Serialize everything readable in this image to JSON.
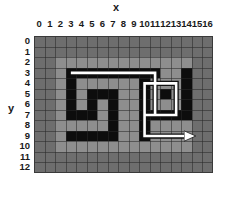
{
  "axes": {
    "x_title": "x",
    "y_title": "y",
    "x_ticks": [
      "0",
      "1",
      "2",
      "3",
      "4",
      "5",
      "6",
      "7",
      "8",
      "9",
      "10",
      "11",
      "12",
      "13",
      "14",
      "15",
      "16"
    ],
    "y_ticks": [
      "0",
      "1",
      "2",
      "3",
      "4",
      "5",
      "6",
      "7",
      "8",
      "9",
      "10",
      "11",
      "12"
    ]
  },
  "colors": {
    "background": "#6e6e6e",
    "open": "#8e8e8e",
    "wall": "#0d0d0d",
    "path": "#ffffff",
    "gridline": "#3a3a3a",
    "text": "#1a1a1a"
  },
  "chart_data": {
    "type": "heatmap",
    "title": "",
    "xlabel": "x",
    "ylabel": "y",
    "xlim": [
      0,
      16
    ],
    "ylim": [
      0,
      12
    ],
    "grid": true,
    "legend": "none",
    "cell_size_px": 10.53,
    "value_legend": {
      "0": "background",
      "1": "open",
      "2": "wall"
    },
    "grid_values": [
      [
        0,
        0,
        0,
        0,
        0,
        0,
        0,
        0,
        0,
        0,
        0,
        0,
        0,
        0,
        0,
        0,
        0
      ],
      [
        0,
        0,
        0,
        0,
        0,
        0,
        0,
        0,
        0,
        0,
        0,
        0,
        0,
        0,
        0,
        0,
        0
      ],
      [
        0,
        0,
        1,
        1,
        1,
        1,
        1,
        1,
        1,
        1,
        1,
        1,
        1,
        1,
        1,
        0,
        0
      ],
      [
        0,
        0,
        1,
        2,
        2,
        2,
        2,
        2,
        2,
        2,
        2,
        2,
        1,
        1,
        2,
        0,
        0
      ],
      [
        0,
        0,
        1,
        2,
        1,
        1,
        1,
        1,
        1,
        1,
        2,
        1,
        1,
        1,
        2,
        0,
        0
      ],
      [
        0,
        0,
        1,
        2,
        1,
        2,
        2,
        2,
        1,
        1,
        2,
        1,
        2,
        1,
        2,
        0,
        0
      ],
      [
        0,
        0,
        1,
        2,
        1,
        2,
        1,
        2,
        1,
        1,
        2,
        1,
        1,
        1,
        2,
        0,
        0
      ],
      [
        0,
        0,
        1,
        2,
        2,
        2,
        1,
        2,
        1,
        1,
        2,
        2,
        2,
        2,
        2,
        0,
        0
      ],
      [
        0,
        0,
        1,
        1,
        1,
        1,
        1,
        2,
        1,
        1,
        2,
        1,
        1,
        1,
        1,
        0,
        0
      ],
      [
        0,
        0,
        1,
        2,
        2,
        2,
        2,
        2,
        1,
        1,
        2,
        1,
        1,
        1,
        1,
        0,
        0
      ],
      [
        0,
        0,
        1,
        1,
        1,
        1,
        1,
        1,
        1,
        1,
        1,
        1,
        1,
        1,
        1,
        0,
        0
      ],
      [
        0,
        0,
        0,
        0,
        0,
        0,
        0,
        0,
        0,
        0,
        0,
        0,
        0,
        0,
        0,
        0,
        0
      ],
      [
        0,
        0,
        0,
        0,
        0,
        0,
        0,
        0,
        0,
        0,
        0,
        0,
        0,
        0,
        0,
        0,
        0
      ]
    ],
    "path": {
      "name": "solution-path",
      "stroke": "#ffffff",
      "arrow_head": "right",
      "waypoints": [
        {
          "x": 3,
          "y": 3
        },
        {
          "x": 11,
          "y": 3
        },
        {
          "x": 11,
          "y": 7
        },
        {
          "x": 10,
          "y": 7
        },
        {
          "x": 10,
          "y": 4
        },
        {
          "x": 13,
          "y": 4
        },
        {
          "x": 13,
          "y": 7
        },
        {
          "x": 10,
          "y": 7
        },
        {
          "x": 10,
          "y": 9
        },
        {
          "x": 14,
          "y": 9
        }
      ]
    }
  }
}
